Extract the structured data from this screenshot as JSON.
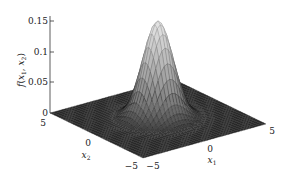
{
  "chart_data": {
    "type": "surface3d",
    "title": "",
    "function": "f(x1, x2) = (1/(2*pi)) * exp(-(x1^2 + x2^2)/2)",
    "zlabel": "f(x1, x2)",
    "xlabel": "x1",
    "ylabel": "x2",
    "x_range": [
      -5,
      5
    ],
    "y_range": [
      -5,
      5
    ],
    "zlim": [
      0,
      0.15
    ],
    "z_ticks": [
      0,
      0.05,
      0.1,
      0.15
    ],
    "z_tick_labels": [
      "0",
      "0.05",
      "0.1",
      "0.15"
    ],
    "x_ticks": [
      -5,
      0,
      5
    ],
    "x_tick_labels": [
      "−5",
      "0",
      "5"
    ],
    "y_ticks": [
      -5,
      0,
      5
    ],
    "y_tick_labels": [
      "−5",
      "0",
      "5"
    ],
    "peak": {
      "x1": 0,
      "x2": 0,
      "value": 0.159
    },
    "grid": false,
    "colormap": "gray",
    "mesh_resolution": 41
  },
  "labels": {
    "zlabel_f": "f",
    "zlabel_open": "(",
    "zlabel_x1": "x",
    "zlabel_sub1": "1",
    "zlabel_comma": ", ",
    "zlabel_x2": "x",
    "zlabel_sub2": "2",
    "zlabel_close": ")",
    "x1_var": "x",
    "x1_sub": "1",
    "x2_var": "x",
    "x2_sub": "2",
    "z_tick_0": "0",
    "z_tick_005": "0.05",
    "z_tick_01": "0.1",
    "z_tick_015": "0.15",
    "x1_tick_neg5": "−5",
    "x1_tick_0": "0",
    "x1_tick_5": "5",
    "x2_tick_neg5": "−5",
    "x2_tick_0": "0",
    "x2_tick_5": "5"
  }
}
